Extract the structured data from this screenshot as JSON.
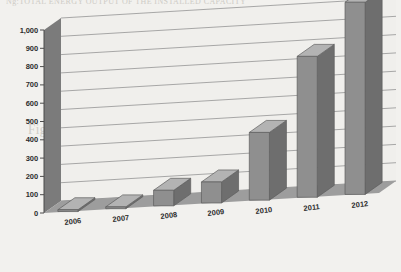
{
  "chart_data": {
    "type": "bar",
    "title": "",
    "subtitle": "",
    "xlabel": "",
    "ylabel": "",
    "categories": [
      "2006",
      "2007",
      "2008",
      "2009",
      "2010",
      "2011",
      "2012"
    ],
    "values": [
      10,
      10,
      85,
      115,
      370,
      770,
      1050
    ],
    "series": [
      {
        "name": "",
        "values": [
          10,
          10,
          85,
          115,
          370,
          770,
          1050
        ]
      }
    ],
    "ylim": [
      0,
      1000
    ],
    "ytick_labels": [
      "1,000",
      "900",
      "800",
      "700",
      "600",
      "500",
      "400",
      "300",
      "200",
      "100",
      "0"
    ],
    "ytick_values": [
      1000,
      900,
      800,
      700,
      600,
      500,
      400,
      300,
      200,
      100,
      0
    ],
    "grid": true,
    "grid_axis": "y",
    "legend": false,
    "legend_position": "none",
    "style": "3d-column",
    "annotations": [],
    "colors": {
      "bar_front": "#8f8f8f",
      "bar_side": "#6e6e6e",
      "bar_top": "#b3b3b3",
      "plot_background": "#f0efec",
      "wall_left": "#7b7b7b",
      "floor": "#9d9d9d",
      "grid_line": "#9a9a9a",
      "text": "#2d2d2d",
      "page_background": "#f2f1ee"
    }
  },
  "bleed_text": {
    "line0": "Ng:TOTAL ENERGY OUTPUT OF THE INSTALLED CAPACITY",
    "line1": "evolution of the PV sector in 2011 and 2012",
    "line2": "Figure 5: Annual installed PV",
    "line3": "the PV sector in the quality of the",
    "line4": "installed capacity in"
  }
}
